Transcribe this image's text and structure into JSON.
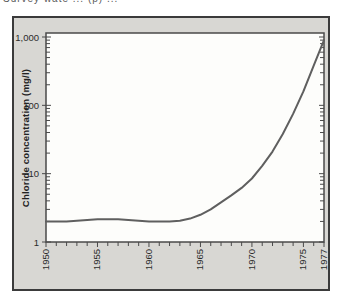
{
  "caption": {
    "fragment": "Survey wate ... (p) ..."
  },
  "figure": {
    "background": "#d8d7d3",
    "border_color": "#3b3b3b",
    "plot_background": "#fdfdfb",
    "frame_color": "#4a4a4a",
    "tick_color": "#4a4a4a",
    "curve_color": "#5f5f5f",
    "text_color": "#2b2b2b"
  },
  "chart_data": {
    "type": "line",
    "title": "",
    "xlabel": "",
    "ylabel": "Chloride concentration (mg/l)",
    "y_scale": "log",
    "ylim": [
      1,
      1000
    ],
    "xlim": [
      1950,
      1977
    ],
    "grid": false,
    "legend": "none",
    "y_tick_labels": [
      "1,000",
      "100",
      "10",
      "1"
    ],
    "y_tick_values": [
      1000,
      100,
      10,
      1
    ],
    "x_tick_labels": [
      "1950",
      "1955",
      "1960",
      "1965",
      "1970",
      "1975",
      "1977"
    ],
    "x_tick_values": [
      1950,
      1955,
      1960,
      1965,
      1970,
      1975,
      1977
    ],
    "x_minor_tick_step": 1,
    "series": [
      {
        "name": "chloride-concentration",
        "x": [
          1950,
          1951,
          1952,
          1953,
          1954,
          1955,
          1956,
          1957,
          1958,
          1959,
          1960,
          1961,
          1962,
          1963,
          1964,
          1965,
          1966,
          1967,
          1968,
          1969,
          1970,
          1971,
          1972,
          1973,
          1974,
          1975,
          1976,
          1977
        ],
        "y": [
          2.0,
          2.0,
          2.0,
          2.05,
          2.1,
          2.15,
          2.15,
          2.15,
          2.1,
          2.05,
          2.0,
          2.0,
          2.0,
          2.05,
          2.2,
          2.5,
          3.0,
          3.8,
          4.8,
          6.2,
          8.5,
          13,
          21,
          38,
          75,
          160,
          380,
          900
        ]
      }
    ]
  }
}
